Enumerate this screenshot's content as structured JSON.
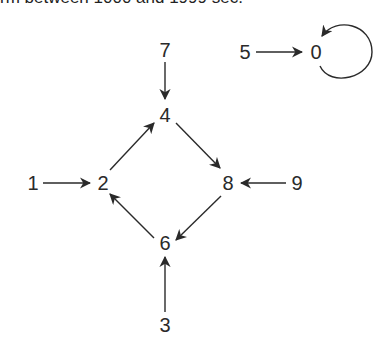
{
  "caption": "rm between 1000 and 1999 sec.",
  "graph": {
    "nodes": [
      {
        "id": "0",
        "label": "0",
        "x": 316,
        "y": 52
      },
      {
        "id": "1",
        "label": "1",
        "x": 33,
        "y": 183
      },
      {
        "id": "2",
        "label": "2",
        "x": 103,
        "y": 183
      },
      {
        "id": "3",
        "label": "3",
        "x": 165,
        "y": 325
      },
      {
        "id": "4",
        "label": "4",
        "x": 165,
        "y": 115
      },
      {
        "id": "5",
        "label": "5",
        "x": 245,
        "y": 52
      },
      {
        "id": "6",
        "label": "6",
        "x": 165,
        "y": 243
      },
      {
        "id": "7",
        "label": "7",
        "x": 165,
        "y": 50
      },
      {
        "id": "8",
        "label": "8",
        "x": 228,
        "y": 183
      },
      {
        "id": "9",
        "label": "9",
        "x": 297,
        "y": 183
      }
    ],
    "edges": [
      {
        "from": "7",
        "to": "4"
      },
      {
        "from": "5",
        "to": "0"
      },
      {
        "from": "0",
        "to": "0"
      },
      {
        "from": "1",
        "to": "2"
      },
      {
        "from": "2",
        "to": "4"
      },
      {
        "from": "4",
        "to": "8"
      },
      {
        "from": "9",
        "to": "8"
      },
      {
        "from": "8",
        "to": "6"
      },
      {
        "from": "6",
        "to": "2"
      },
      {
        "from": "3",
        "to": "6"
      }
    ]
  },
  "colors": {
    "ink": "#2a2a2a",
    "background": "#ffffff"
  }
}
